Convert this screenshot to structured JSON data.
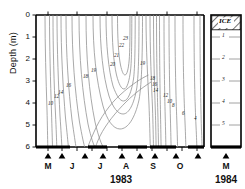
{
  "figure": {
    "y_axis_label": "Depth (m)",
    "y_ticks": [
      "0",
      "1",
      "2",
      "3",
      "4",
      "5",
      "6"
    ],
    "left_panel": {
      "year_label": "1983",
      "month_labels": [
        "M",
        "J",
        "J",
        "A",
        "S",
        "O"
      ]
    },
    "right_panel": {
      "year_label": "1984",
      "month_labels": [
        "M"
      ],
      "ice_label": "ICE",
      "tick_labels": [
        "1",
        "2",
        "3",
        "4",
        "5"
      ]
    }
  },
  "chart_data": {
    "type": "line",
    "title": "",
    "xlabel": "1983",
    "ylabel": "Depth (m)",
    "xlim": [
      0,
      215
    ],
    "ylim": [
      0,
      6
    ],
    "grid": false,
    "legend": "none",
    "contour_levels": [
      4,
      6,
      8,
      10,
      12,
      14,
      16,
      18,
      19,
      20,
      21,
      22,
      23
    ],
    "contour_unit": "degrees C",
    "labels": [
      {
        "text": "10",
        "x": 48,
        "y": 101
      },
      {
        "text": "12",
        "x": 54,
        "y": 94
      },
      {
        "text": "14",
        "x": 58,
        "y": 90
      },
      {
        "text": "16",
        "x": 66,
        "y": 83
      },
      {
        "text": "18",
        "x": 83,
        "y": 74
      },
      {
        "text": "19",
        "x": 91,
        "y": 68
      },
      {
        "text": "20",
        "x": 110,
        "y": 62
      },
      {
        "text": "21",
        "x": 114,
        "y": 53
      },
      {
        "text": "22",
        "x": 119,
        "y": 43
      },
      {
        "text": "23",
        "x": 123,
        "y": 36
      },
      {
        "text": "19",
        "x": 140,
        "y": 61
      },
      {
        "text": "18",
        "x": 150,
        "y": 76
      },
      {
        "text": "16",
        "x": 152,
        "y": 82
      },
      {
        "text": "14",
        "x": 153,
        "y": 88
      },
      {
        "text": "12",
        "x": 163,
        "y": 93
      },
      {
        "text": "10",
        "x": 167,
        "y": 99
      },
      {
        "text": "8",
        "x": 172,
        "y": 103
      },
      {
        "text": "6",
        "x": 182,
        "y": 111
      },
      {
        "text": "4",
        "x": 194,
        "y": 116
      }
    ],
    "month_tick_positions": [
      46,
      62,
      85,
      104,
      128,
      152,
      177,
      199
    ],
    "depth_axis_range_m": [
      0,
      6
    ]
  }
}
